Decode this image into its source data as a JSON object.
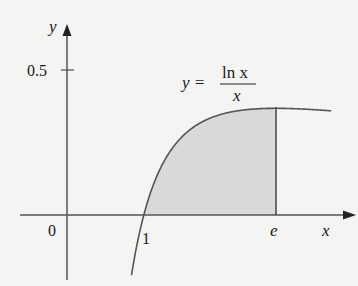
{
  "chart_data": {
    "type": "area",
    "title": "",
    "function": "y = ln x / x",
    "annotation": {
      "lhs": "y =",
      "numerator": "ln x",
      "denominator": "x"
    },
    "xlabel": "x",
    "ylabel": "y",
    "x_ticks": [
      {
        "value": 0,
        "label": "0"
      },
      {
        "value": 1,
        "label": "1"
      },
      {
        "value": 2.718,
        "label": "e"
      }
    ],
    "y_ticks": [
      {
        "value": 0.5,
        "label": "0.5"
      }
    ],
    "shaded_region": {
      "from": 1,
      "to": 2.718,
      "description": "area under curve between x=1 and x=e"
    },
    "xlim": [
      -0.7,
      3.8
    ],
    "ylim": [
      -0.25,
      0.72
    ],
    "grid": false,
    "legend": "none",
    "sample_points": [
      {
        "x": 0.84,
        "y": -0.208
      },
      {
        "x": 1,
        "y": 0
      },
      {
        "x": 1.5,
        "y": 0.27
      },
      {
        "x": 2,
        "y": 0.347
      },
      {
        "x": 2.718,
        "y": 0.368
      },
      {
        "x": 3,
        "y": 0.366
      },
      {
        "x": 3.44,
        "y": 0.359
      }
    ]
  },
  "labels": {
    "y_axis": "y",
    "x_axis": "x",
    "origin": "0",
    "tick_one": "1",
    "tick_e": "e",
    "tick_half": "0.5",
    "eq_lhs": "y =",
    "eq_num": "ln x",
    "eq_den": "x"
  },
  "colors": {
    "background": "#f4f4f2",
    "axis": "#555555",
    "curve": "#555555",
    "shade": "#d9d9d9"
  }
}
